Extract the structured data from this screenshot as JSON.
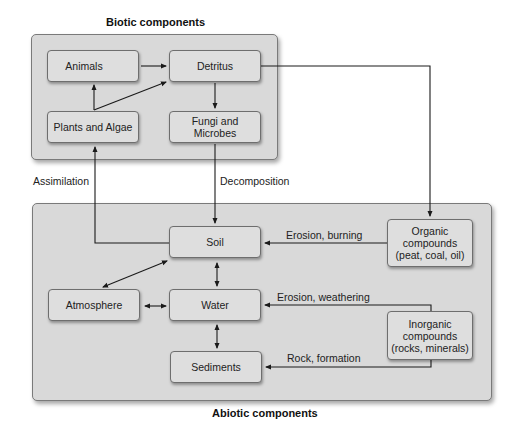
{
  "biotic": {
    "title": "Biotic components",
    "nodes": {
      "animals": "Animals",
      "detritus": "Detritus",
      "plants": "Plants and Algae",
      "fungi_line1": "Fungi and",
      "fungi_line2": "Microbes"
    }
  },
  "abiotic": {
    "title": "Abiotic components",
    "nodes": {
      "soil": "Soil",
      "atmosphere": "Atmosphere",
      "water": "Water",
      "sediments": "Sediments",
      "organic_line1": "Organic",
      "organic_line2": "compounds",
      "organic_line3": "(peat, coal, oil)",
      "inorganic_line1": "Inorganic",
      "inorganic_line2": "compounds",
      "inorganic_line3": "(rocks, minerals)"
    }
  },
  "edges": {
    "assimilation": "Assimilation",
    "decomposition": "Decomposition",
    "erosion_burning": "Erosion, burning",
    "erosion_weathering": "Erosion, weathering",
    "rock_formation": "Rock, formation"
  },
  "colors": {
    "panel": "#d9d9d9",
    "node": "#dedede",
    "line": "#1a1a1a"
  }
}
